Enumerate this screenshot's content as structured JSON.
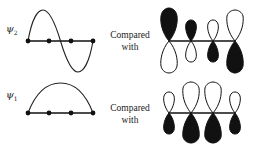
{
  "diagram": {
    "rows": [
      {
        "id": "psi2",
        "label_symbol": "ψ",
        "label_subscript": "2",
        "wave_shape": "full-sine",
        "atoms": 4,
        "compare_line1": "Compared",
        "compare_line2": "with",
        "orbitals": [
          {
            "top": "filled",
            "bottom": "open",
            "size": "large"
          },
          {
            "top": "filled",
            "bottom": "open",
            "size": "small"
          },
          {
            "top": "open",
            "bottom": "filled",
            "size": "small"
          },
          {
            "top": "open",
            "bottom": "filled",
            "size": "large"
          }
        ]
      },
      {
        "id": "psi1",
        "label_symbol": "ψ",
        "label_subscript": "1",
        "wave_shape": "half-sine-arc",
        "atoms": 4,
        "compare_line1": "Compared",
        "compare_line2": "with",
        "orbitals": [
          {
            "top": "open",
            "bottom": "filled",
            "size": "small"
          },
          {
            "top": "open",
            "bottom": "filled",
            "size": "large"
          },
          {
            "top": "open",
            "bottom": "filled",
            "size": "large"
          },
          {
            "top": "open",
            "bottom": "filled",
            "size": "small"
          }
        ]
      }
    ],
    "colors": {
      "ink": "#111111",
      "background": "#ffffff"
    }
  }
}
